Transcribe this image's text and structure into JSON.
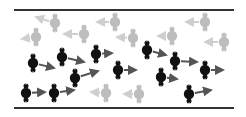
{
  "colors": {
    "plate": "#333333",
    "particle_dark": "#111111",
    "arrow_dark": "#555555",
    "particle_light": "#bdbdbd",
    "arrow_light": "#cfcfcf",
    "background": "#ffffff"
  },
  "plates": {
    "top": {
      "x1": 14,
      "x2": 234,
      "y": 10,
      "width": 2
    },
    "bottom": {
      "x1": 14,
      "x2": 234,
      "y": 108,
      "width": 2
    }
  },
  "particles_light": [
    {
      "x": 55,
      "y": 23,
      "ax": 36,
      "ay": 17,
      "direction": "left"
    },
    {
      "x": 36,
      "y": 37,
      "ax": 22,
      "ay": 39,
      "direction": "left"
    },
    {
      "x": 84,
      "y": 34,
      "ax": 64,
      "ay": 34,
      "direction": "left"
    },
    {
      "x": 115,
      "y": 22,
      "ax": 97,
      "ay": 22,
      "direction": "left"
    },
    {
      "x": 133,
      "y": 38,
      "ax": 117,
      "ay": 37,
      "direction": "left"
    },
    {
      "x": 172,
      "y": 36,
      "ax": 158,
      "ay": 36,
      "direction": "left"
    },
    {
      "x": 205,
      "y": 22,
      "ax": 186,
      "ay": 22,
      "direction": "left"
    },
    {
      "x": 224,
      "y": 42,
      "ax": 205,
      "ay": 42,
      "direction": "left"
    },
    {
      "x": 139,
      "y": 94,
      "ax": 124,
      "ay": 94,
      "direction": "left"
    },
    {
      "x": 106,
      "y": 93,
      "ax": 91,
      "ay": 92,
      "direction": "left"
    }
  ],
  "particles_dark": [
    {
      "x": 33,
      "y": 63,
      "ax": 54,
      "ay": 68,
      "direction": "right"
    },
    {
      "x": 62,
      "y": 57,
      "ax": 84,
      "ay": 62,
      "direction": "right"
    },
    {
      "x": 96,
      "y": 54,
      "ax": 112,
      "ay": 53,
      "direction": "right"
    },
    {
      "x": 75,
      "y": 78,
      "ax": 98,
      "ay": 71,
      "direction": "right"
    },
    {
      "x": 26,
      "y": 93,
      "ax": 45,
      "ay": 92,
      "direction": "right"
    },
    {
      "x": 54,
      "y": 93,
      "ax": 74,
      "ay": 90,
      "direction": "right"
    },
    {
      "x": 118,
      "y": 70,
      "ax": 136,
      "ay": 70,
      "direction": "right"
    },
    {
      "x": 147,
      "y": 50,
      "ax": 166,
      "ay": 55,
      "direction": "right"
    },
    {
      "x": 161,
      "y": 77,
      "ax": 177,
      "ay": 79,
      "direction": "right"
    },
    {
      "x": 175,
      "y": 61,
      "ax": 197,
      "ay": 62,
      "direction": "right"
    },
    {
      "x": 205,
      "y": 70,
      "ax": 223,
      "ay": 70,
      "direction": "right"
    },
    {
      "x": 189,
      "y": 94,
      "ax": 211,
      "ay": 90,
      "direction": "right"
    }
  ]
}
